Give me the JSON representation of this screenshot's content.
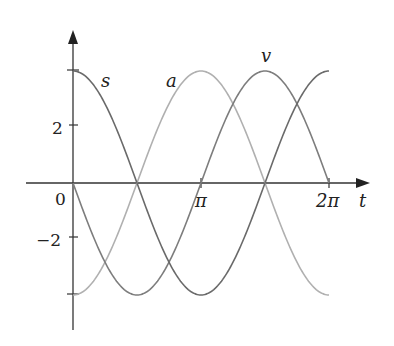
{
  "chart_data": {
    "type": "line",
    "title": "",
    "xlabel": "t",
    "ylabel": "",
    "x_ticks": [
      {
        "value": 0,
        "label": "0"
      },
      {
        "value": 3.14159,
        "label": "π"
      },
      {
        "value": 6.28318,
        "label": "2π"
      }
    ],
    "y_ticks": [
      {
        "value": 2,
        "label": "2"
      },
      {
        "value": -2,
        "label": "−2"
      }
    ],
    "xlim": [
      0,
      6.28318
    ],
    "ylim": [
      -4,
      4
    ],
    "grid": false,
    "legend": "inline curve labels",
    "series": [
      {
        "name": "s",
        "formula": "4cos(t)",
        "color": "#6a6a6a",
        "x": [
          0,
          0.785,
          1.571,
          2.356,
          3.142,
          3.927,
          4.712,
          5.498,
          6.283
        ],
        "values": [
          4,
          2.83,
          0,
          -2.83,
          -4,
          -2.83,
          0,
          2.83,
          4
        ]
      },
      {
        "name": "v",
        "formula": "-4sin(t)",
        "color": "#7d7d7d",
        "x": [
          0,
          0.785,
          1.571,
          2.356,
          3.142,
          3.927,
          4.712,
          5.498,
          6.283
        ],
        "values": [
          0,
          -2.83,
          -4,
          -2.83,
          0,
          2.83,
          4,
          2.83,
          0
        ]
      },
      {
        "name": "a",
        "formula": "-4cos(t)",
        "color": "#b0b0b0",
        "x": [
          0,
          0.785,
          1.571,
          2.356,
          3.142,
          3.927,
          4.712,
          5.498,
          6.283
        ],
        "values": [
          -4,
          -2.83,
          0,
          2.83,
          4,
          2.83,
          0,
          -2.83,
          -4
        ]
      }
    ],
    "annotations": [
      {
        "text": "s",
        "near": "s curve at t≈0.6"
      },
      {
        "text": "a",
        "near": "a curve at t≈2.5"
      },
      {
        "text": "v",
        "near": "v curve peak at t≈3π/2"
      }
    ]
  },
  "labels": {
    "x_axis": "t",
    "origin": "0",
    "pi": "π",
    "two_pi": "2π",
    "y_pos2": "2",
    "y_neg2": "−2",
    "curve_s": "s",
    "curve_a": "a",
    "curve_v": "v"
  }
}
